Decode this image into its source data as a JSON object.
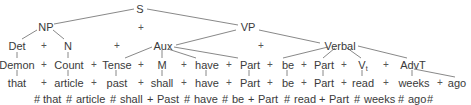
{
  "nodes": {
    "S": "S",
    "NP": "NP",
    "VP": "VP",
    "Det": "Det",
    "N": "N",
    "Aux": "Aux",
    "Verbal": "Verbal",
    "Demon": "Demon",
    "Count": "Count",
    "Tense": "Tense",
    "M": "M",
    "have1": "have",
    "Part1": "Part",
    "be1": "be",
    "Part2": "Part",
    "Vt": "V",
    "Vt_sub": "t",
    "AdvT": "AdvT"
  },
  "terminals": {
    "that": "that",
    "article": "article",
    "past": "past",
    "shall": "shall",
    "have": "have",
    "Part1": "Part",
    "be": "be",
    "Part2": "Part",
    "read": "read",
    "weeks": "weeks",
    "ago": "ago"
  },
  "plus": "+",
  "derived_string": [
    "#",
    "that",
    "#",
    "article",
    "#",
    "shall",
    "+",
    "Past",
    "#",
    "have",
    "#",
    "be",
    "+",
    "Part",
    "#",
    "read",
    "+",
    "Part",
    "#",
    "weeks",
    "#",
    "ago",
    "#"
  ]
}
